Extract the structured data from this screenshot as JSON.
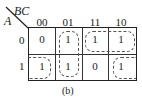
{
  "map": {
    "var_col": "BC",
    "var_row": "A",
    "col_headers": [
      "00",
      "01",
      "11",
      "10"
    ],
    "row_headers": [
      "0",
      "1"
    ],
    "cells": [
      [
        "0",
        "1",
        "1",
        "1"
      ],
      [
        "1",
        "1",
        "0",
        "1"
      ]
    ],
    "loops": [
      "A=1 corners 00 and 10 (wrap)",
      "column 01",
      "row 0, columns 11 and 10"
    ]
  },
  "caption": "(b)"
}
